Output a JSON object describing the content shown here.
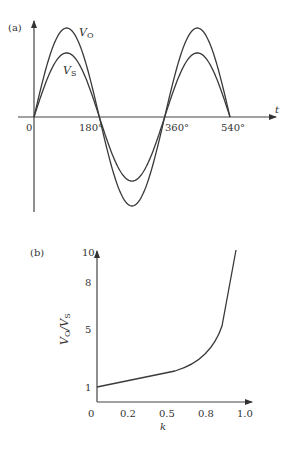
{
  "chart_data": [
    {
      "panel": "(a)",
      "type": "line",
      "title": "",
      "xlabel": "t",
      "ylabel": "",
      "x_ticks": [
        "0",
        "180°",
        "360°",
        "540°"
      ],
      "x_range_deg": [
        0,
        540
      ],
      "series": [
        {
          "name": "VO",
          "label_main": "V",
          "label_sub": "O",
          "function": "sine",
          "amplitude": 1.0
        },
        {
          "name": "VS",
          "label_main": "V",
          "label_sub": "S",
          "function": "sine",
          "amplitude": 0.72
        }
      ],
      "grid": false
    },
    {
      "panel": "(b)",
      "type": "line",
      "title": "",
      "xlabel": "k",
      "ylabel_main": "V",
      "ylabel_sub1": "O",
      "ylabel_sep": "/V",
      "ylabel_sub2": "S",
      "x_ticks": [
        "0",
        "0.2",
        "0.5",
        "0.8",
        "1.0"
      ],
      "y_ticks": [
        "1",
        "5",
        "8",
        "10"
      ],
      "xlim": [
        0,
        1.0
      ],
      "ylim": [
        0,
        10
      ],
      "series": [
        {
          "name": "VO/VS",
          "x": [
            0.0,
            0.2,
            0.4,
            0.55,
            0.65,
            0.75,
            0.82,
            0.88,
            0.92,
            0.97
          ],
          "y": [
            1.0,
            1.3,
            1.6,
            1.9,
            2.4,
            3.3,
            4.3,
            5.4,
            7.5,
            10.0
          ]
        }
      ],
      "grid": false
    }
  ],
  "panel_a": {
    "label": "(a)",
    "t_label": "t",
    "ticks": [
      "0",
      "180°",
      "360°",
      "540°"
    ],
    "vo_main": "V",
    "vo_sub": "O",
    "vs_main": "V",
    "vs_sub": "S"
  },
  "panel_b": {
    "label": "(b)",
    "k_label": "k",
    "x_ticks": [
      "0",
      "0.2",
      "0.5",
      "0.8",
      "1.0"
    ],
    "y_ticks": [
      "1",
      "5",
      "8",
      "10"
    ],
    "ylabel_main": "V",
    "ylabel_sub1": "O",
    "ylabel_sep": "/V",
    "ylabel_sub2": "S"
  }
}
